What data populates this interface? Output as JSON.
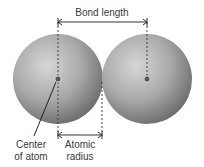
{
  "diagram": {
    "labels": {
      "bond_length": "Bond length",
      "center_line1": "Center",
      "center_line2": "of atom",
      "radius_line1": "Atomic",
      "radius_line2": "radius"
    },
    "atoms": [
      {
        "name": "left-atom",
        "cx": 58,
        "cy": 79,
        "r": 45
      },
      {
        "name": "right-atom",
        "cx": 147,
        "cy": 79,
        "r": 45
      }
    ],
    "colors": {
      "sphere_light": "#d2d2d2",
      "sphere_dark": "#6e6e6e",
      "line": "#333333",
      "nucleus": "#555555"
    }
  }
}
